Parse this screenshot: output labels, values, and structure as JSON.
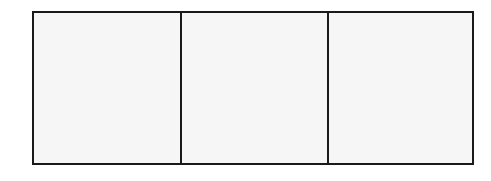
{
  "diagram": {
    "type": "empty-box-row",
    "cell_count": 3,
    "cells": [
      {
        "label": ""
      },
      {
        "label": ""
      },
      {
        "label": ""
      }
    ],
    "colors": {
      "border": "#1a1a1a",
      "fill": "#f6f6f6",
      "background": "#ffffff"
    }
  }
}
